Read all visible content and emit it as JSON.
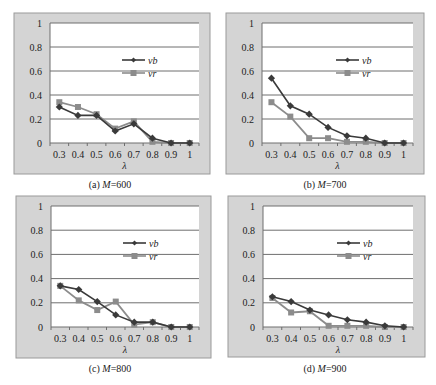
{
  "figure": {
    "panels_count": 4
  },
  "chart_data": [
    {
      "type": "line",
      "panel_label": "(a)",
      "caption_prefix": "(a) ",
      "caption_var": "M",
      "caption_value": "=600",
      "title": "",
      "xlabel": "λ",
      "ylabel": "",
      "categories": [
        "0.3",
        "0.4",
        "0.5",
        "0.6",
        "0.7",
        "0.8",
        "0.9",
        "1"
      ],
      "yticks": [
        "0",
        "0.2",
        "0.4",
        "0.6",
        "0.8",
        "1"
      ],
      "ylim": [
        0,
        1
      ],
      "grid": true,
      "legend_position": "center-right",
      "series": [
        {
          "name": "vb",
          "marker": "diamond",
          "color": "#3a3a3a",
          "values": [
            0.3,
            0.23,
            0.23,
            0.1,
            0.16,
            0.04,
            0.0,
            0.0
          ]
        },
        {
          "name": "vr",
          "marker": "square",
          "color": "#8c8c8c",
          "values": [
            0.34,
            0.3,
            0.24,
            0.12,
            0.18,
            0.01,
            0.0,
            0.0
          ]
        }
      ]
    },
    {
      "type": "line",
      "panel_label": "(b)",
      "caption_prefix": "(b) ",
      "caption_var": "M",
      "caption_value": "=700",
      "title": "",
      "xlabel": "λ",
      "ylabel": "",
      "categories": [
        "0.3",
        "0.4",
        "0.5",
        "0.6",
        "0.7",
        "0.8",
        "0.9",
        "1"
      ],
      "yticks": [
        "0",
        "0.2",
        "0.4",
        "0.6",
        "0.8",
        "1"
      ],
      "ylim": [
        0,
        1
      ],
      "grid": true,
      "legend_position": "center-right",
      "series": [
        {
          "name": "vb",
          "marker": "diamond",
          "color": "#3a3a3a",
          "values": [
            0.54,
            0.31,
            0.24,
            0.13,
            0.06,
            0.04,
            0.0,
            0.0
          ]
        },
        {
          "name": "vr",
          "marker": "square",
          "color": "#8c8c8c",
          "values": [
            0.34,
            0.22,
            0.04,
            0.04,
            0.01,
            0.01,
            0.0,
            0.0
          ]
        }
      ]
    },
    {
      "type": "line",
      "panel_label": "(c)",
      "caption_prefix": "(c) ",
      "caption_var": "M",
      "caption_value": "=800",
      "title": "",
      "xlabel": "λ",
      "ylabel": "",
      "categories": [
        "0.3",
        "0.4",
        "0.5",
        "0.6",
        "0.7",
        "0.8",
        "0.9",
        "1"
      ],
      "yticks": [
        "0",
        "0.2",
        "0.4",
        "0.6",
        "0.8",
        "1"
      ],
      "ylim": [
        0,
        1
      ],
      "grid": true,
      "legend_position": "center-right",
      "series": [
        {
          "name": "vb",
          "marker": "diamond",
          "color": "#3a3a3a",
          "values": [
            0.34,
            0.31,
            0.21,
            0.1,
            0.04,
            0.04,
            0.0,
            0.0
          ]
        },
        {
          "name": "vr",
          "marker": "square",
          "color": "#8c8c8c",
          "values": [
            0.34,
            0.22,
            0.14,
            0.21,
            0.02,
            0.04,
            0.0,
            0.0
          ]
        }
      ]
    },
    {
      "type": "line",
      "panel_label": "(d)",
      "caption_prefix": "(d) ",
      "caption_var": "M",
      "caption_value": "=900",
      "title": "",
      "xlabel": "λ",
      "ylabel": "",
      "categories": [
        "0.3",
        "0.4",
        "0.5",
        "0.6",
        "0.7",
        "0.8",
        "0.9",
        "1"
      ],
      "yticks": [
        "0",
        "0.2",
        "0.4",
        "0.6",
        "0.8",
        "1"
      ],
      "ylim": [
        0,
        1
      ],
      "grid": true,
      "legend_position": "center-right",
      "series": [
        {
          "name": "vb",
          "marker": "diamond",
          "color": "#3a3a3a",
          "values": [
            0.25,
            0.21,
            0.14,
            0.1,
            0.06,
            0.04,
            0.01,
            0.0
          ]
        },
        {
          "name": "vr",
          "marker": "square",
          "color": "#8c8c8c",
          "values": [
            0.24,
            0.12,
            0.13,
            0.01,
            0.01,
            0.01,
            0.0,
            0.0
          ]
        }
      ]
    }
  ]
}
